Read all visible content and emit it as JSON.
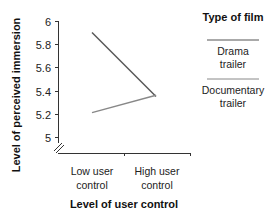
{
  "chart_data": {
    "type": "line",
    "title": "",
    "xlabel": "Level of user control",
    "ylabel": "Level of perceived immersion",
    "categories": [
      "Low user\ncontrol",
      "High user\ncontrol"
    ],
    "category_lines": [
      [
        "Low user",
        "control"
      ],
      [
        "High user",
        "control"
      ]
    ],
    "yticks": [
      "6",
      "5.8",
      "5.6",
      "5.4",
      "5.2",
      "5"
    ],
    "ytick_values": [
      6,
      5.8,
      5.6,
      5.4,
      5.2,
      5
    ],
    "ylim": [
      4.85,
      6
    ],
    "axis_break": true,
    "grid": false,
    "legend_position": "right",
    "legend_title": "Type of film",
    "series": [
      {
        "name": "Drama trailer",
        "name_lines": [
          "Drama",
          "trailer"
        ],
        "values": [
          5.9,
          5.35
        ],
        "color": "#555555"
      },
      {
        "name": "Documentary trailer",
        "name_lines": [
          "Documentary",
          "trailer"
        ],
        "values": [
          5.21,
          5.36
        ],
        "color": "#888888"
      }
    ]
  }
}
